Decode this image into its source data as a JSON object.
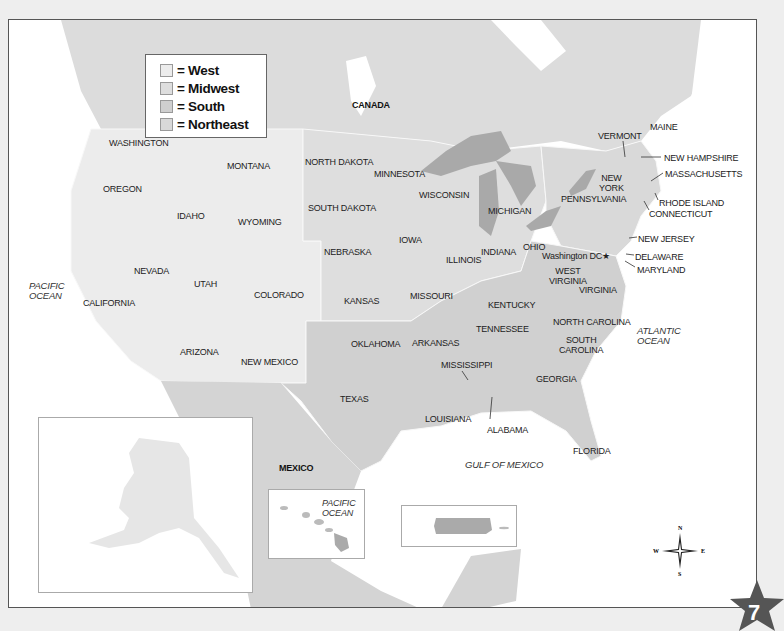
{
  "legend": {
    "items": [
      {
        "label": "= West",
        "color": "#ececec"
      },
      {
        "label": "= Midwest",
        "color": "#dedede"
      },
      {
        "label": "= South",
        "color": "#cfcfcf"
      },
      {
        "label": "= Northeast",
        "color": "#d8d8d8"
      }
    ]
  },
  "colors": {
    "west": "#ececec",
    "midwest": "#dedede",
    "south": "#d0d0d0",
    "northeast": "#d9d9d9",
    "canada": "#dcdcdc",
    "mexico": "#d4d4d4",
    "lakes": "#a9a9a9",
    "water": "#ffffff",
    "border": "#f7f7f7"
  },
  "countries": {
    "canada": "CANADA",
    "mexico": "MEXICO"
  },
  "oceans": {
    "pacific_main": "PACIFIC\nOCEAN",
    "pacific_hawaii": "PACIFIC\nOCEAN",
    "atlantic": "ATLANTIC\nOCEAN",
    "gulf": "GULF OF MEXICO"
  },
  "states": [
    {
      "name": "WASHINGTON",
      "x": 108,
      "y": 137
    },
    {
      "name": "OREGON",
      "x": 102,
      "y": 183
    },
    {
      "name": "MONTANA",
      "x": 226,
      "y": 160
    },
    {
      "name": "IDAHO",
      "x": 176,
      "y": 210
    },
    {
      "name": "WYOMING",
      "x": 237,
      "y": 216
    },
    {
      "name": "NEVADA",
      "x": 133,
      "y": 265
    },
    {
      "name": "UTAH",
      "x": 193,
      "y": 278
    },
    {
      "name": "CALIFORNIA",
      "x": 82,
      "y": 297
    },
    {
      "name": "COLORADO",
      "x": 253,
      "y": 289
    },
    {
      "name": "ARIZONA",
      "x": 179,
      "y": 346
    },
    {
      "name": "NEW MEXICO",
      "x": 240,
      "y": 356
    },
    {
      "name": "NORTH DAKOTA",
      "x": 304,
      "y": 156
    },
    {
      "name": "SOUTH DAKOTA",
      "x": 307,
      "y": 202
    },
    {
      "name": "MINNESOTA",
      "x": 373,
      "y": 168
    },
    {
      "name": "WISCONSIN",
      "x": 418,
      "y": 189
    },
    {
      "name": "MICHIGAN",
      "x": 487,
      "y": 205
    },
    {
      "name": "NEBRASKA",
      "x": 323,
      "y": 246
    },
    {
      "name": "IOWA",
      "x": 398,
      "y": 234
    },
    {
      "name": "ILLINOIS",
      "x": 445,
      "y": 254
    },
    {
      "name": "INDIANA",
      "x": 480,
      "y": 246
    },
    {
      "name": "OHIO",
      "x": 522,
      "y": 241
    },
    {
      "name": "KANSAS",
      "x": 343,
      "y": 295
    },
    {
      "name": "MISSOURI",
      "x": 409,
      "y": 290
    },
    {
      "name": "KENTUCKY",
      "x": 487,
      "y": 299
    },
    {
      "name": "WEST\nVIRGINIA",
      "x": 548,
      "y": 265
    },
    {
      "name": "VIRGINIA",
      "x": 578,
      "y": 284
    },
    {
      "name": "TENNESSEE",
      "x": 475,
      "y": 323
    },
    {
      "name": "NORTH CAROLINA",
      "x": 552,
      "y": 316
    },
    {
      "name": "SOUTH\nCAROLINA",
      "x": 558,
      "y": 334
    },
    {
      "name": "OKLAHOMA",
      "x": 350,
      "y": 338
    },
    {
      "name": "ARKANSAS",
      "x": 411,
      "y": 337
    },
    {
      "name": "MISSISSIPPI",
      "x": 440,
      "y": 359
    },
    {
      "name": "GEORGIA",
      "x": 535,
      "y": 373
    },
    {
      "name": "TEXAS",
      "x": 339,
      "y": 393
    },
    {
      "name": "LOUISIANA",
      "x": 424,
      "y": 413
    },
    {
      "name": "ALABAMA",
      "x": 486,
      "y": 424
    },
    {
      "name": "FLORIDA",
      "x": 572,
      "y": 445
    },
    {
      "name": "PENNSYLVANIA",
      "x": 560,
      "y": 193
    },
    {
      "name": "NEW\nYORK",
      "x": 598,
      "y": 172
    },
    {
      "name": "VERMONT",
      "x": 597,
      "y": 130
    },
    {
      "name": "MAINE",
      "x": 649,
      "y": 121
    },
    {
      "name": "NEW HAMPSHIRE",
      "x": 663,
      "y": 152
    },
    {
      "name": "MASSACHUSETTS",
      "x": 664,
      "y": 168
    },
    {
      "name": "RHODE ISLAND",
      "x": 658,
      "y": 197
    },
    {
      "name": "CONNECTICUT",
      "x": 648,
      "y": 208
    },
    {
      "name": "NEW JERSEY",
      "x": 637,
      "y": 233
    },
    {
      "name": "DELAWARE",
      "x": 634,
      "y": 251
    },
    {
      "name": "MARYLAND",
      "x": 636,
      "y": 264
    },
    {
      "name": "ALASKA",
      "x": 164,
      "y": 472
    },
    {
      "name": "HAWAII",
      "x": 286,
      "y": 531
    },
    {
      "name": "PUERTO RICO",
      "x": 435,
      "y": 524
    }
  ],
  "capital": {
    "label": "Washington DC★",
    "x": 541,
    "y": 250
  },
  "compass": {
    "n": "N",
    "s": "S",
    "e": "E",
    "w": "W"
  },
  "page_number": "7"
}
